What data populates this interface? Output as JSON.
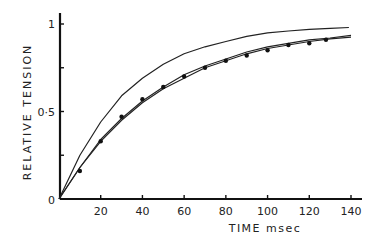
{
  "chart_data": {
    "type": "line",
    "title": "",
    "xlabel": "TIME msec",
    "ylabel": "RELATIVE TENSION",
    "xlim": [
      0,
      140
    ],
    "ylim": [
      0,
      1
    ],
    "x_ticks": [
      20,
      40,
      60,
      80,
      100,
      120,
      140
    ],
    "x_tick_labels": [
      "20",
      "40",
      "60",
      "80",
      "100",
      "120",
      "140"
    ],
    "y_ticks": [
      0,
      0.25,
      0.5,
      0.75,
      1
    ],
    "y_tick_labels": [
      "0",
      "",
      "0·5",
      "",
      "1"
    ],
    "origin_label": "0",
    "grid": false,
    "legend": null,
    "series": [
      {
        "name": "upper curve",
        "style": "line",
        "x": [
          0,
          10,
          20,
          30,
          40,
          50,
          60,
          70,
          80,
          90,
          100,
          110,
          120,
          130,
          139
        ],
        "values": [
          0,
          0.25,
          0.44,
          0.59,
          0.69,
          0.77,
          0.83,
          0.87,
          0.9,
          0.93,
          0.95,
          0.96,
          0.97,
          0.975,
          0.98
        ]
      },
      {
        "name": "middle curve",
        "style": "line",
        "x": [
          0,
          10,
          20,
          30,
          40,
          50,
          60,
          70,
          80,
          90,
          100,
          110,
          120,
          130,
          140
        ],
        "values": [
          0,
          0.18,
          0.34,
          0.46,
          0.56,
          0.64,
          0.71,
          0.76,
          0.8,
          0.84,
          0.87,
          0.89,
          0.91,
          0.92,
          0.935
        ]
      },
      {
        "name": "lower curve",
        "style": "line",
        "x": [
          0,
          10,
          20,
          30,
          40,
          50,
          60,
          70,
          80,
          90,
          100,
          110,
          120,
          130,
          140
        ],
        "values": [
          0,
          0.18,
          0.33,
          0.45,
          0.55,
          0.63,
          0.69,
          0.75,
          0.79,
          0.83,
          0.86,
          0.88,
          0.9,
          0.915,
          0.925
        ]
      },
      {
        "name": "measured points",
        "style": "scatter",
        "x": [
          10,
          20,
          30,
          40,
          50,
          60,
          70,
          80,
          90,
          100,
          110,
          120,
          128
        ],
        "values": [
          0.16,
          0.33,
          0.47,
          0.57,
          0.64,
          0.7,
          0.75,
          0.79,
          0.82,
          0.85,
          0.88,
          0.89,
          0.91
        ]
      }
    ]
  }
}
